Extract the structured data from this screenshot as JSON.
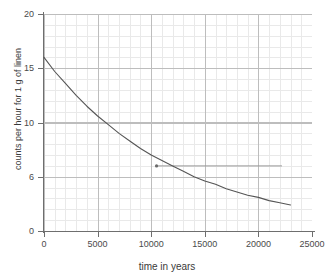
{
  "chart_data": {
    "type": "line",
    "title": "",
    "xlabel": "time in years",
    "ylabel": "counts per hour for 1 g of linen",
    "xlim": [
      0,
      25000
    ],
    "ylim": [
      0,
      20
    ],
    "grid": true,
    "grid_minor": true,
    "legend": "none",
    "x_ticks": [
      0,
      5000,
      10000,
      15000,
      20000,
      25000
    ],
    "x_tick_labels": [
      "0",
      "5000",
      "10000",
      "15000",
      "20000",
      "25000"
    ],
    "y_ticks": [
      0,
      5,
      10,
      15,
      20
    ],
    "y_tick_labels": [
      "0",
      "6",
      "10",
      "15",
      "20"
    ],
    "series": [
      {
        "name": "radiocarbon decay curve",
        "color": "#555555",
        "x": [
          0,
          1000,
          2000,
          3000,
          4000,
          5000,
          6000,
          7000,
          8000,
          9000,
          10000,
          11000,
          12000,
          13000,
          14000,
          15000,
          16000,
          17000,
          18000,
          19000,
          20000,
          21000,
          22000,
          23000
        ],
        "y": [
          16.0,
          14.7,
          13.6,
          12.5,
          11.5,
          10.6,
          9.8,
          9.0,
          8.3,
          7.6,
          7.0,
          6.5,
          6.0,
          5.5,
          5.0,
          4.6,
          4.3,
          3.9,
          3.6,
          3.3,
          3.1,
          2.8,
          2.6,
          2.4
        ]
      }
    ],
    "annotations": [
      {
        "name": "reference-level-line",
        "type": "horizontal-line",
        "y": 6.0,
        "x_start": 10500,
        "x_end": 22200,
        "color": "#9a9a9a"
      },
      {
        "name": "intersection-marker",
        "type": "point",
        "x": 10500,
        "y": 6.0,
        "color": "#6a6a6a"
      }
    ]
  },
  "axes": {
    "x_title": "time in years",
    "y_title": "counts per hour for 1 g of linen"
  }
}
